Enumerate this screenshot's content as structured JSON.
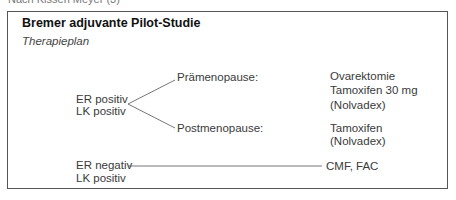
{
  "caption": "Nach Kissen Meyer (3)",
  "title": "Bremer adjuvante Pilot-Studie",
  "subtitle": "Therapieplan",
  "group_positive": {
    "line1": "ER positiv",
    "line2": "LK positiv",
    "branches": [
      {
        "label": "Prämenopause:",
        "therapy": [
          "Ovarektomie",
          "Tamoxifen 30 mg",
          "(Nolvadex)"
        ]
      },
      {
        "label": "Postmenopause:",
        "therapy": [
          "Tamoxifen",
          "(Nolvadex)"
        ]
      }
    ]
  },
  "group_negative": {
    "line1": "ER negativ",
    "line2": "LK positiv",
    "therapy": "CMF, FAC"
  }
}
